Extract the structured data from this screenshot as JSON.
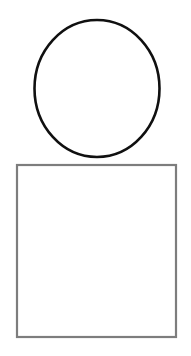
{
  "canvas": {
    "width": 191,
    "height": 356,
    "background_color": "#ffffff",
    "title": "Two geometric shapes line drawing"
  },
  "shapes": [
    {
      "id": "circle",
      "name": "circle-shape",
      "kind": "ellipse",
      "label": "Circle",
      "center_x": 97,
      "center_y": 88.5,
      "radius_x": 62.5,
      "radius_y": 68.5,
      "stroke_color": "#101010",
      "stroke_width": 2.6,
      "fill_color": "none"
    },
    {
      "id": "square",
      "name": "square-shape",
      "kind": "rect",
      "label": "Square",
      "x": 17,
      "y": 165,
      "width": 159,
      "height": 172,
      "stroke_color": "#7d7d7d",
      "stroke_width": 2.2,
      "fill_color": "none"
    }
  ]
}
